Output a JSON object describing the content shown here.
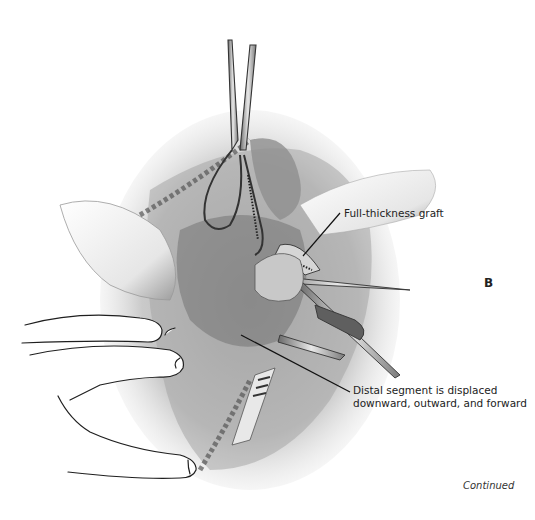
{
  "figure": {
    "panel_letter": "B",
    "labels": {
      "graft": "Full-thickness graft",
      "distal_line1": "Distal segment is displaced",
      "distal_line2": "downward, outward, and forward"
    },
    "footer": "Continued"
  },
  "colors": {
    "ink": "#222222",
    "shade_dark": "#555555",
    "shade_mid": "#9a9a9a",
    "shade_light": "#d9d9d9",
    "background": "#ffffff"
  }
}
